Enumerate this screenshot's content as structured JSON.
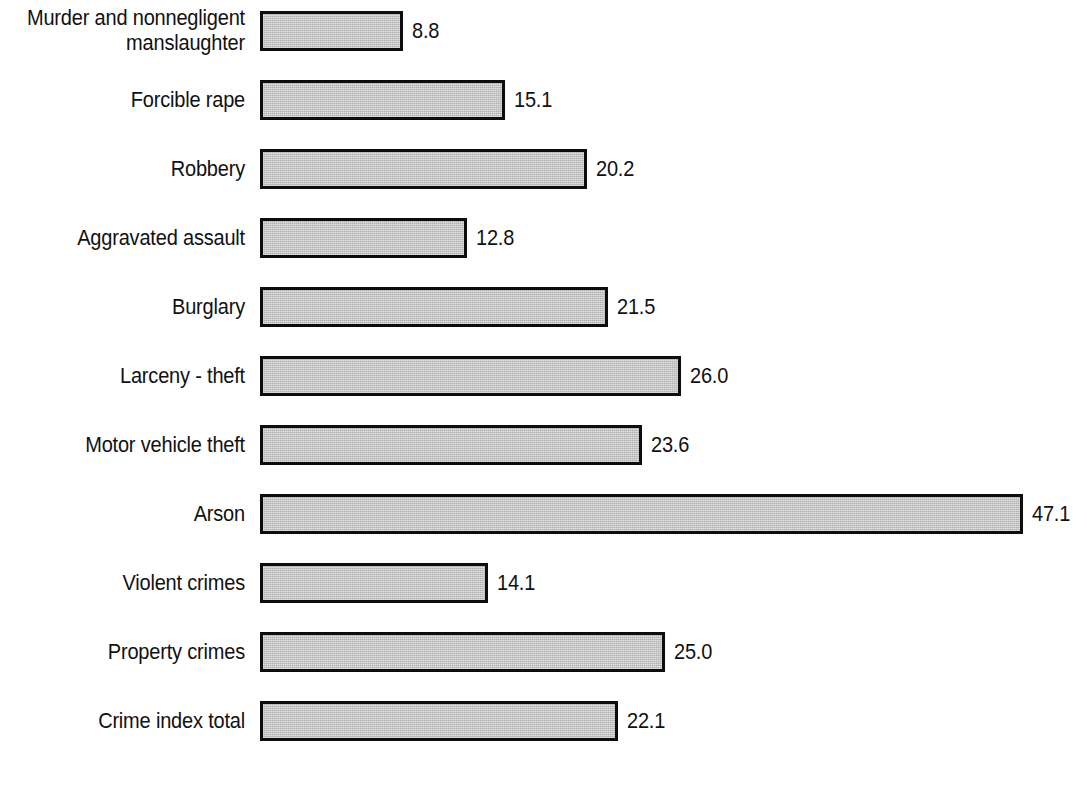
{
  "chart_data": {
    "type": "bar",
    "orientation": "horizontal",
    "title": "",
    "subtitle": "",
    "xlabel": "",
    "ylabel": "",
    "grid": false,
    "legend": false,
    "axis_visible": false,
    "xlim": [
      0,
      47.1
    ],
    "categories": [
      "Murder and nonnegligent\nmanslaughter",
      "Forcible rape",
      "Robbery",
      "Aggravated assault",
      "Burglary",
      "Larceny - theft",
      "Motor vehicle theft",
      "Arson",
      "Violent crimes",
      "Property crimes",
      "Crime index total"
    ],
    "values": [
      8.8,
      15.1,
      20.2,
      12.8,
      21.5,
      26.0,
      23.6,
      47.1,
      14.1,
      25.0,
      22.1
    ],
    "value_labels": [
      "8.8",
      "15.1",
      "20.2",
      "12.8",
      "21.5",
      "26.0",
      "23.6",
      "47.1",
      "14.1",
      "25.0",
      "22.1"
    ],
    "bar_fill_color": "#c4c4c4",
    "bar_border_color": "#0d0d0d",
    "background_color": "#ffffff"
  },
  "layout": {
    "bar_origin_x_px": 260,
    "px_per_unit": 16.2,
    "row_pitch_px": 69,
    "first_row_top_px": 8,
    "bar_height_px": 40,
    "label_column_width_px": 245
  }
}
